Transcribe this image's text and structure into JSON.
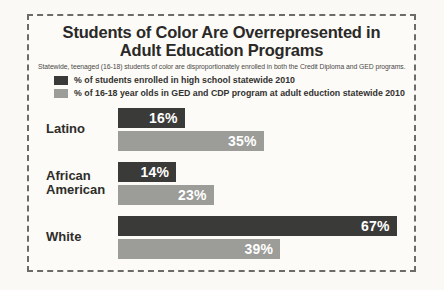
{
  "colors": {
    "dark_bar": "#3a3a38",
    "light_bar": "#9c9c98",
    "border": "#6b6b68",
    "title_text": "#2a2927"
  },
  "chart": {
    "title_lines": [
      "Students of Color Are Overrepresented in",
      "Adult Education Programs"
    ],
    "subtitle": "Statewide, teenaged (16-18) students of color are disproportionately enrolled in both the Credit Diploma and GED programs."
  },
  "chart_data": {
    "type": "bar",
    "orientation": "horizontal",
    "title": "Students of Color Are Overrepresented in Adult Education Programs",
    "subtitle": "Statewide, teenaged (16-18) students of color are disproportionately enrolled in both the Credit Diploma and GED programs.",
    "categories": [
      "Latino",
      "African American",
      "White"
    ],
    "series": [
      {
        "name": "% of students enrolled in high school statewide 2010",
        "color": "#3a3a38",
        "values": [
          16,
          14,
          67
        ]
      },
      {
        "name": "% of 16-18 year olds in GED and CDP program at adult eduction statewide 2010",
        "color": "#9c9c98",
        "values": [
          35,
          23,
          39
        ]
      }
    ],
    "value_labels": [
      [
        "16%",
        "35%"
      ],
      [
        "14%",
        "23%"
      ],
      [
        "67%",
        "39%"
      ]
    ],
    "xlabel": "",
    "ylabel": "",
    "xlim": [
      0,
      69
    ],
    "grid": false,
    "legend_position": "top-left",
    "value_label_position": "inside-right"
  }
}
